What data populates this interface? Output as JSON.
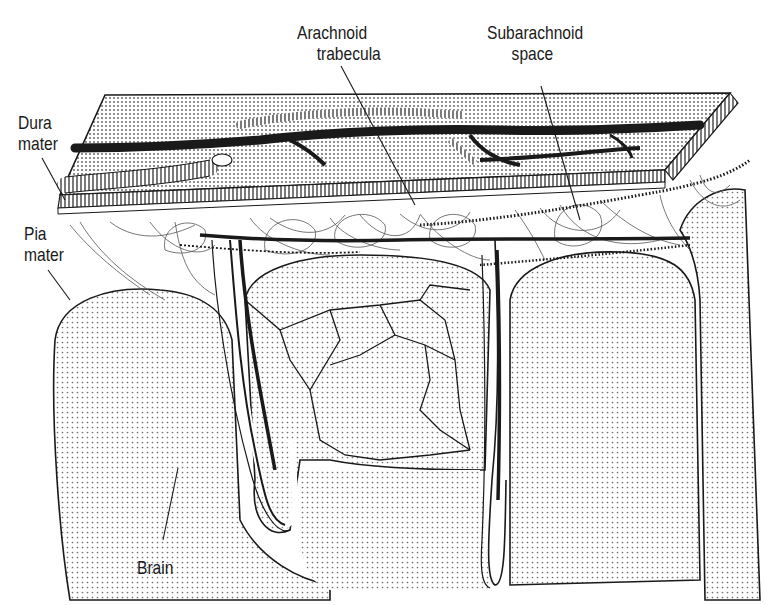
{
  "figure": {
    "colors": {
      "background": "#ffffff",
      "ink": "#1a1a1a",
      "dot": "#7a7a7a"
    }
  },
  "labels": {
    "arachnoid_trabecula": {
      "line1": "Arachnoid",
      "line2": "trabecula"
    },
    "subarachnoid_space": {
      "line1": "Subarachnoid",
      "line2": "space"
    },
    "dura_mater": {
      "line1": "Dura",
      "line2": "mater"
    },
    "pia_mater": {
      "line1": "Pia",
      "line2": "mater"
    },
    "brain": {
      "line1": "Brain"
    }
  }
}
